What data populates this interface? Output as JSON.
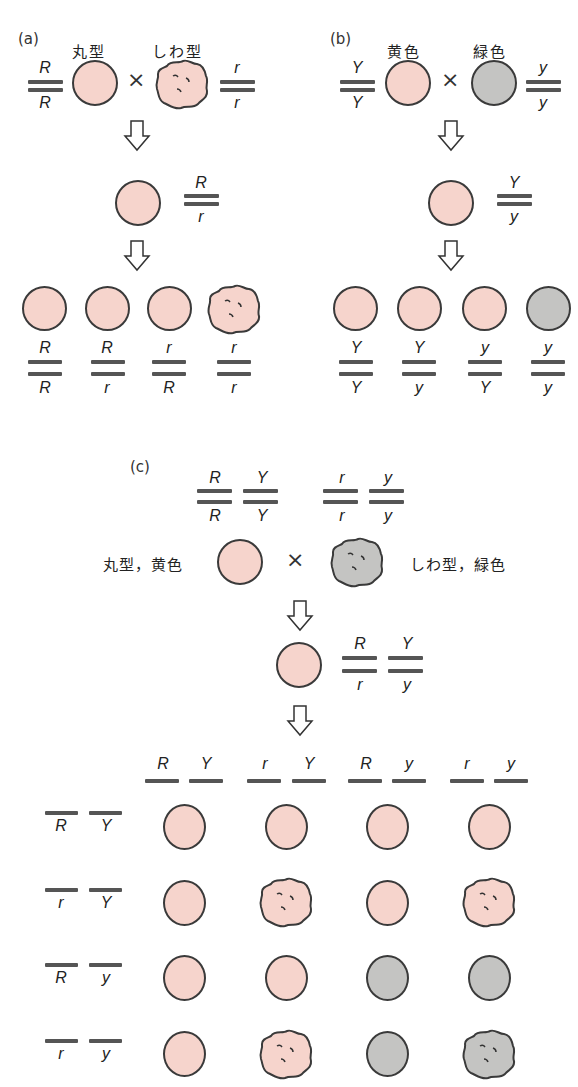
{
  "colors": {
    "yellow_pea": "#f6d4cc",
    "green_pea": "#c4c4c2",
    "outline": "#3a3a3a",
    "chromosome": "#555555"
  },
  "panel_a": {
    "label": "(a)",
    "parent_left": {
      "phenotype": "丸型",
      "top": "R",
      "bottom": "R",
      "shape": "round",
      "color": "yellow"
    },
    "parent_right": {
      "phenotype": "しわ型",
      "top": "r",
      "bottom": "r",
      "shape": "wrinkled",
      "color": "yellow"
    },
    "cross_symbol": "×",
    "f1": {
      "top": "R",
      "bottom": "r",
      "shape": "round",
      "color": "yellow"
    },
    "f2": [
      {
        "top": "R",
        "bottom": "R",
        "shape": "round",
        "color": "yellow"
      },
      {
        "top": "R",
        "bottom": "r",
        "shape": "round",
        "color": "yellow"
      },
      {
        "top": "r",
        "bottom": "R",
        "shape": "round",
        "color": "yellow"
      },
      {
        "top": "r",
        "bottom": "r",
        "shape": "wrinkled",
        "color": "yellow"
      }
    ]
  },
  "panel_b": {
    "label": "(b)",
    "parent_left": {
      "phenotype": "黄色",
      "top": "Y",
      "bottom": "Y",
      "shape": "round",
      "color": "yellow"
    },
    "parent_right": {
      "phenotype": "緑色",
      "top": "y",
      "bottom": "y",
      "shape": "round",
      "color": "green"
    },
    "cross_symbol": "×",
    "f1": {
      "top": "Y",
      "bottom": "y",
      "shape": "round",
      "color": "yellow"
    },
    "f2": [
      {
        "top": "Y",
        "bottom": "Y",
        "shape": "round",
        "color": "yellow"
      },
      {
        "top": "Y",
        "bottom": "y",
        "shape": "round",
        "color": "yellow"
      },
      {
        "top": "y",
        "bottom": "Y",
        "shape": "round",
        "color": "yellow"
      },
      {
        "top": "y",
        "bottom": "y",
        "shape": "round",
        "color": "green"
      }
    ]
  },
  "panel_c": {
    "label": "(c)",
    "parent_left": {
      "phenotype": "丸型，黄色",
      "genes": [
        {
          "top": "R",
          "bottom": "R"
        },
        {
          "top": "Y",
          "bottom": "Y"
        }
      ],
      "shape": "round",
      "color": "yellow"
    },
    "parent_right": {
      "phenotype": "しわ型，緑色",
      "genes": [
        {
          "top": "r",
          "bottom": "r"
        },
        {
          "top": "y",
          "bottom": "y"
        }
      ],
      "shape": "wrinkled",
      "color": "green"
    },
    "cross_symbol": "×",
    "f1": {
      "genes": [
        {
          "top": "R",
          "bottom": "r"
        },
        {
          "top": "Y",
          "bottom": "y"
        }
      ],
      "shape": "round",
      "color": "yellow"
    },
    "gametes_columns": [
      {
        "a": "R",
        "b": "Y"
      },
      {
        "a": "r",
        "b": "Y"
      },
      {
        "a": "R",
        "b": "y"
      },
      {
        "a": "r",
        "b": "y"
      }
    ],
    "gametes_rows": [
      {
        "a": "R",
        "b": "Y"
      },
      {
        "a": "r",
        "b": "Y"
      },
      {
        "a": "R",
        "b": "y"
      },
      {
        "a": "r",
        "b": "y"
      }
    ],
    "grid": [
      [
        {
          "shape": "round",
          "color": "yellow"
        },
        {
          "shape": "round",
          "color": "yellow"
        },
        {
          "shape": "round",
          "color": "yellow"
        },
        {
          "shape": "round",
          "color": "yellow"
        }
      ],
      [
        {
          "shape": "round",
          "color": "yellow"
        },
        {
          "shape": "wrinkled",
          "color": "yellow"
        },
        {
          "shape": "round",
          "color": "yellow"
        },
        {
          "shape": "wrinkled",
          "color": "yellow"
        }
      ],
      [
        {
          "shape": "round",
          "color": "yellow"
        },
        {
          "shape": "round",
          "color": "yellow"
        },
        {
          "shape": "round",
          "color": "green"
        },
        {
          "shape": "round",
          "color": "green"
        }
      ],
      [
        {
          "shape": "round",
          "color": "yellow"
        },
        {
          "shape": "wrinkled",
          "color": "yellow"
        },
        {
          "shape": "round",
          "color": "green"
        },
        {
          "shape": "wrinkled",
          "color": "green"
        }
      ]
    ]
  }
}
